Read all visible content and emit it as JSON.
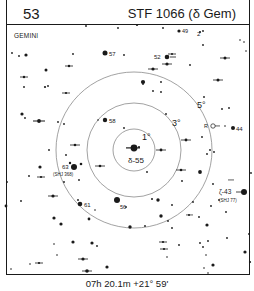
{
  "header": {
    "chart_number": "53",
    "title": "STF 1066 (δ Gem)"
  },
  "constellation": "GEMINI",
  "caption": "07h 20.1m  +21° 59'",
  "rings": [
    {
      "label": "1°",
      "r": 21
    },
    {
      "label": "3°",
      "r": 47
    },
    {
      "label": "5°",
      "r": 78
    }
  ],
  "center": {
    "x": 134,
    "y": 150,
    "label": "δ-55"
  },
  "labels": {
    "s49": "49",
    "s57": "57",
    "s52": "52",
    "s58": "58",
    "s44": "44",
    "s63": "63",
    "s63_sub": "(SHJ 368)",
    "s61": "61",
    "s56": "56",
    "s43": "ζ-43",
    "s43_sub": "(SHJ 77)",
    "r_marker": "R",
    "s2": "2",
    "ring1": "1°",
    "ring3": "3°",
    "ring5": "5°"
  },
  "colors": {
    "ink": "#1a1a1a",
    "ring": "#8a8a8a",
    "background": "#ffffff"
  }
}
